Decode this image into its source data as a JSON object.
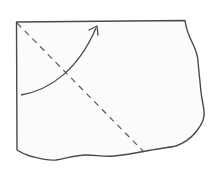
{
  "diagram": {
    "type": "fold-instruction",
    "colors": {
      "background": "#ffffff",
      "paper_fill": "#fbfbfb",
      "stroke": "#4a4a4a"
    },
    "elements": [
      {
        "name": "paper-sheet",
        "shape": "torn-rectangle"
      },
      {
        "name": "fold-line",
        "style": "dashed",
        "from": [
          16,
          22
        ],
        "to": [
          144,
          152
        ]
      },
      {
        "name": "fold-arrow",
        "style": "curved",
        "from": [
          21,
          95
        ],
        "to": [
          97,
          26
        ]
      }
    ]
  }
}
